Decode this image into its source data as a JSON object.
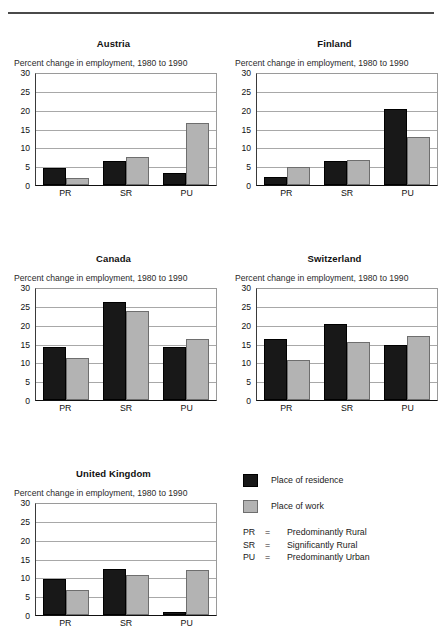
{
  "meta": {
    "subtitle_text": "Percent change in employment, 1980 to 1990"
  },
  "legend": {
    "series": [
      {
        "key": "residence",
        "label": "Place of residence",
        "color": "#181818"
      },
      {
        "key": "work",
        "label": "Place of work",
        "color": "#b3b3b3"
      }
    ],
    "abbreviations": [
      {
        "code": "PR",
        "eq": "=",
        "text": "Predominantly Rural"
      },
      {
        "code": "SR",
        "eq": "=",
        "text": "Significantly Rural"
      },
      {
        "code": "PU",
        "eq": "=",
        "text": "Predominantly Urban"
      }
    ]
  },
  "chart_data": [
    {
      "type": "bar",
      "title": "Austria",
      "subtitle": "Percent change in employment, 1980 to 1990",
      "xlabel": "",
      "ylabel": "",
      "ylim": [
        0,
        30
      ],
      "yticks": [
        30,
        25,
        20,
        15,
        10,
        5,
        0
      ],
      "grid": true,
      "legend_position": "external",
      "categories": [
        "PR",
        "SR",
        "PU"
      ],
      "series": [
        {
          "name": "Place of residence",
          "values": [
            4.4,
            6.4,
            3.2
          ]
        },
        {
          "name": "Place of work",
          "values": [
            1.8,
            7.5,
            16.4
          ]
        }
      ]
    },
    {
      "type": "bar",
      "title": "Finland",
      "subtitle": "Percent change in employment, 1980 to 1990",
      "xlabel": "",
      "ylabel": "",
      "ylim": [
        0,
        30
      ],
      "yticks": [
        30,
        25,
        20,
        15,
        10,
        5,
        0
      ],
      "grid": true,
      "legend_position": "external",
      "categories": [
        "PR",
        "SR",
        "PU"
      ],
      "series": [
        {
          "name": "Place of residence",
          "values": [
            2.0,
            6.3,
            20.1
          ]
        },
        {
          "name": "Place of work",
          "values": [
            4.9,
            6.7,
            12.8
          ]
        }
      ]
    },
    {
      "type": "bar",
      "title": "Canada",
      "subtitle": "Percent change in employment, 1980 to 1990",
      "xlabel": "",
      "ylabel": "",
      "ylim": [
        0,
        30
      ],
      "yticks": [
        30,
        25,
        20,
        15,
        10,
        5,
        0
      ],
      "grid": true,
      "legend_position": "external",
      "categories": [
        "PR",
        "SR",
        "PU"
      ],
      "series": [
        {
          "name": "Place of residence",
          "values": [
            14.0,
            25.9,
            14.0
          ]
        },
        {
          "name": "Place of work",
          "values": [
            11.2,
            23.5,
            16.3
          ]
        }
      ]
    },
    {
      "type": "bar",
      "title": "Switzerland",
      "subtitle": "Percent change in employment, 1980 to 1990",
      "xlabel": "",
      "ylabel": "",
      "ylim": [
        0,
        30
      ],
      "yticks": [
        30,
        25,
        20,
        15,
        10,
        5,
        0
      ],
      "grid": true,
      "legend_position": "external",
      "categories": [
        "PR",
        "SR",
        "PU"
      ],
      "series": [
        {
          "name": "Place of residence",
          "values": [
            16.3,
            20.2,
            14.6
          ]
        },
        {
          "name": "Place of work",
          "values": [
            10.7,
            15.3,
            16.9
          ]
        }
      ]
    },
    {
      "type": "bar",
      "title": "United Kingdom",
      "subtitle": "Percent change in employment, 1980 to 1990",
      "xlabel": "",
      "ylabel": "",
      "ylim": [
        0,
        30
      ],
      "yticks": [
        30,
        25,
        20,
        15,
        10,
        5,
        0
      ],
      "grid": true,
      "legend_position": "external",
      "categories": [
        "PR",
        "SR",
        "PU"
      ],
      "series": [
        {
          "name": "Place of residence",
          "values": [
            9.6,
            12.3,
            0.8
          ]
        },
        {
          "name": "Place of work",
          "values": [
            6.7,
            10.5,
            11.9
          ]
        }
      ]
    }
  ]
}
